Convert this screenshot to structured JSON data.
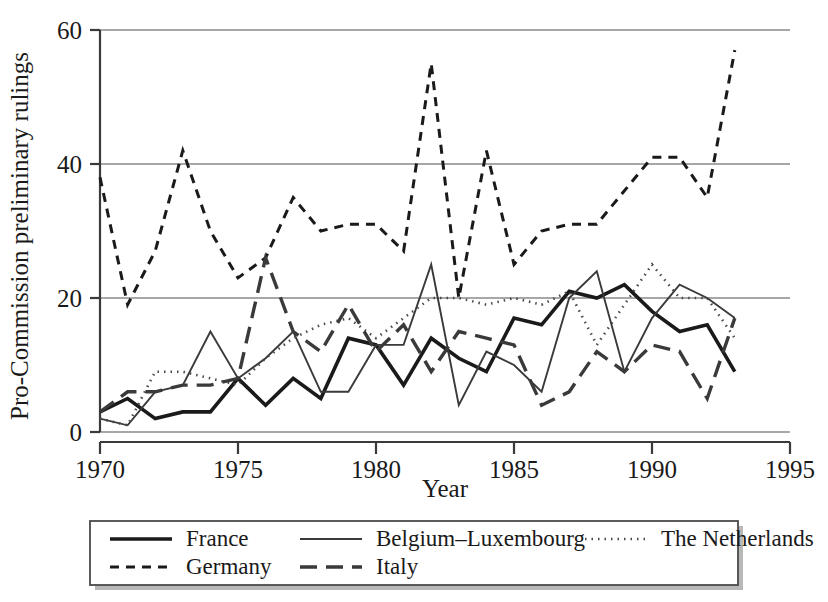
{
  "chart_data": {
    "type": "line",
    "title": "",
    "xlabel": "Year",
    "ylabel": "Pro-Commission preliminary rulings",
    "xlim": [
      1970,
      1995
    ],
    "ylim": [
      0,
      60
    ],
    "xticks": [
      1970,
      1975,
      1980,
      1985,
      1990,
      1995
    ],
    "yticks": [
      0,
      20,
      40,
      60
    ],
    "grid": true,
    "legend_position": "below-plot",
    "x": [
      1970,
      1971,
      1972,
      1973,
      1974,
      1975,
      1976,
      1977,
      1978,
      1979,
      1980,
      1981,
      1982,
      1983,
      1984,
      1985,
      1986,
      1987,
      1988,
      1989,
      1990,
      1991,
      1992,
      1993
    ],
    "series": [
      {
        "name": "France",
        "style": "solid",
        "width": 3.6,
        "color": "#1a1a1a",
        "values": [
          3,
          5,
          2,
          3,
          3,
          8,
          4,
          8,
          5,
          14,
          13,
          7,
          14,
          11,
          9,
          17,
          16,
          21,
          20,
          22,
          18,
          15,
          16,
          9
        ]
      },
      {
        "name": "Belgium–Luxembourg",
        "style": "solid",
        "width": 1.9,
        "color": "#3a3a3a",
        "values": [
          2,
          1,
          6,
          7,
          15,
          8,
          11,
          15,
          6,
          6,
          13,
          13,
          25,
          4,
          12,
          10,
          6,
          20,
          24,
          9,
          17,
          22,
          20,
          17
        ]
      },
      {
        "name": "The Netherlands",
        "style": "dotted",
        "width": 2.6,
        "color": "#4a4a4a",
        "values": [
          2,
          1,
          9,
          9,
          8,
          7,
          11,
          14,
          16,
          17,
          14,
          17,
          20,
          20,
          19,
          20,
          19,
          21,
          13,
          19,
          25,
          20,
          20,
          14
        ]
      },
      {
        "name": "Germany",
        "style": "dashed",
        "width": 3.0,
        "color": "#1a1a1a",
        "values": [
          38,
          19,
          27,
          42,
          30,
          23,
          26,
          35,
          30,
          31,
          31,
          27,
          55,
          20,
          42,
          25,
          30,
          31,
          31,
          36,
          41,
          41,
          35,
          57
        ]
      },
      {
        "name": "Italy",
        "style": "longdash",
        "width": 3.4,
        "color": "#3a3a3a",
        "values": [
          3,
          6,
          6,
          7,
          7,
          8,
          26,
          15,
          12,
          19,
          12,
          16,
          9,
          15,
          14,
          13,
          4,
          6,
          12,
          9,
          13,
          12,
          5,
          17
        ]
      }
    ]
  },
  "axes": {
    "y_tick_labels": [
      "60",
      "40",
      "20",
      "0"
    ],
    "x_tick_labels": [
      "1970",
      "1975",
      "1980",
      "1985",
      "1990",
      "1995"
    ],
    "x_axis_title": "Year",
    "y_axis_title": "Pro-Commission preliminary rulings"
  },
  "legend": {
    "entries": [
      {
        "label": "France",
        "style": "solid-thick"
      },
      {
        "label": "Belgium–Luxembourg",
        "style": "solid-thin"
      },
      {
        "label": "The Netherlands",
        "style": "dotted"
      },
      {
        "label": "Germany",
        "style": "dashed"
      },
      {
        "label": "Italy",
        "style": "longdash"
      }
    ]
  }
}
